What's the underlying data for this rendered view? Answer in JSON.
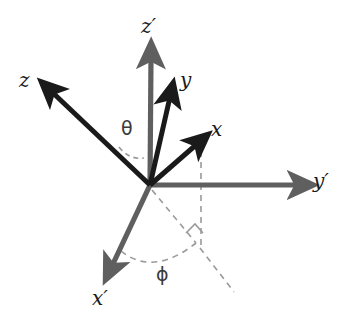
{
  "figure": {
    "background": "#ffffff",
    "width": 346,
    "height": 328,
    "origin": {
      "x": 150,
      "y": 185
    },
    "colors": {
      "dark_axis": "#1a1a1a",
      "gray_axis": "#5a5a5a",
      "dashed": "#9a9a9a",
      "label": "#1a1a1a",
      "greek_label": "#3a3a3a"
    }
  },
  "axes": [
    {
      "id": "z-prime",
      "label": "z′",
      "color": "#5f5f5f",
      "style": "solid",
      "from": {
        "x": 150,
        "y": 185
      },
      "to": {
        "x": 151,
        "y": 52
      },
      "label_pos": {
        "x": 141,
        "y": 18
      }
    },
    {
      "id": "z",
      "label": "z",
      "color": "#1a1a1a",
      "style": "solid",
      "from": {
        "x": 150,
        "y": 185
      },
      "to": {
        "x": 44,
        "y": 84
      },
      "label_pos": {
        "x": 19,
        "y": 70
      }
    },
    {
      "id": "y",
      "label": "y",
      "color": "#1a1a1a",
      "style": "solid",
      "from": {
        "x": 150,
        "y": 185
      },
      "to": {
        "x": 173,
        "y": 88
      },
      "label_pos": {
        "x": 180,
        "y": 72
      }
    },
    {
      "id": "x",
      "label": "x",
      "color": "#1a1a1a",
      "style": "solid",
      "from": {
        "x": 150,
        "y": 185
      },
      "to": {
        "x": 204,
        "y": 137
      },
      "label_pos": {
        "x": 211,
        "y": 121
      }
    },
    {
      "id": "y-prime",
      "label": "y′",
      "color": "#5f5f5f",
      "style": "solid",
      "from": {
        "x": 150,
        "y": 185
      },
      "to": {
        "x": 306,
        "y": 185
      },
      "label_pos": {
        "x": 313,
        "y": 172
      }
    },
    {
      "id": "x-prime",
      "label": "x′",
      "color": "#5f5f5f",
      "style": "solid",
      "from": {
        "x": 150,
        "y": 185
      },
      "to": {
        "x": 107,
        "y": 276
      },
      "label_pos": {
        "x": 92,
        "y": 288
      }
    }
  ],
  "angles": [
    {
      "id": "theta",
      "symbol": "θ",
      "label_pos": {
        "x": 121,
        "y": 120
      },
      "between": [
        "z",
        "z-prime"
      ],
      "arc": "M 120,148 Q 131,159 143,157"
    },
    {
      "id": "phi",
      "symbol": "ϕ",
      "label_pos": {
        "x": 156,
        "y": 265
      },
      "between": [
        "x-prime",
        "projection"
      ],
      "arc": "M 122,252 Q 152,275 196,244"
    }
  ],
  "dashed_guides": [
    {
      "id": "x-vertical-drop",
      "d": "M 201,140 L 201,247"
    },
    {
      "id": "origin-to-projection",
      "d": "M 152,190 L 196,243"
    },
    {
      "id": "projection-extension",
      "d": "M 199,247 L 234,292"
    },
    {
      "id": "right-angle-marker",
      "d": "M 186,232 L 195,224 L 202,233"
    }
  ],
  "labels_summary": [
    "z′",
    "z",
    "y",
    "x",
    "y′",
    "x′",
    "θ",
    "ϕ"
  ]
}
